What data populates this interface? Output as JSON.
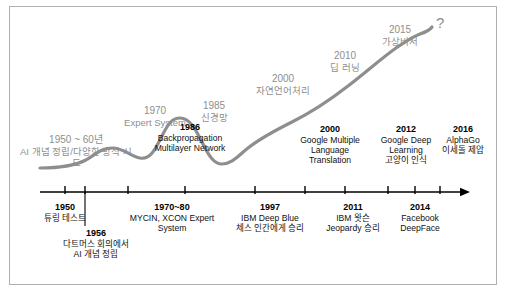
{
  "diagram": {
    "curve_color": "#8e8e8e",
    "axis_color": "#000000",
    "upper_label_color": "#8e8e8e",
    "lower_label_color": "#111111",
    "end_marker": "?"
  },
  "upper_labels": [
    {
      "year": "1950 ~ 60년",
      "text": "AI 개념 정립/다양한 방식 시도",
      "x": 76,
      "y": 134
    },
    {
      "year": "1970",
      "text": "Expert System",
      "x": 155,
      "y": 105
    },
    {
      "year": "1985",
      "text": "신경망",
      "x": 214,
      "y": 100
    },
    {
      "year": "2000",
      "text": "자연언어처리",
      "x": 283,
      "y": 73
    },
    {
      "year": "2010",
      "text": "딥 러닝",
      "x": 345,
      "y": 50
    },
    {
      "year": "2015",
      "text": "가상비서",
      "x": 400,
      "y": 24
    }
  ],
  "lower_labels": [
    {
      "year": "1986",
      "text": "Backpropagation\nMultilayer Network",
      "x": 190,
      "y": 122
    },
    {
      "year": "2000",
      "text": "Google Multiple\nLanguage\nTranslation",
      "x": 330,
      "y": 124
    },
    {
      "year": "2012",
      "text": "Google Deep\nLearning\n고양이 인식",
      "x": 406,
      "y": 124
    },
    {
      "year": "2016",
      "text": "AlphaGo\n이세돌 제압",
      "x": 463,
      "y": 124
    }
  ],
  "axis": {
    "y": 192,
    "x_start": 40,
    "x_end": 470,
    "ticks": [
      65,
      85,
      128,
      185,
      255,
      305,
      345,
      388,
      415,
      440
    ]
  },
  "bottom_labels": [
    {
      "year": "1950",
      "text": "튜링 테스트",
      "x": 65,
      "y": 202,
      "tick_x": 65,
      "drop": 8
    },
    {
      "year": "1956",
      "text": "다트머스 회의에서\nAI 개념 정립",
      "x": 96,
      "y": 228,
      "tick_x": 85,
      "drop": 34
    },
    {
      "year": "1970~80",
      "text": "MYCIN, XCON Expert\nSystem",
      "x": 172,
      "y": 202,
      "tick_x": 128,
      "drop": 8
    },
    {
      "year": "1997",
      "text": "IBM Deep Blue\n체스 인간에게 승리",
      "x": 270,
      "y": 202,
      "tick_x": 255,
      "drop": 8
    },
    {
      "year": "2011",
      "text": "IBM 왓슨\nJeopardy 승리",
      "x": 353,
      "y": 202,
      "tick_x": 345,
      "drop": 8
    },
    {
      "year": "2014",
      "text": "Facebook\nDeepFace",
      "x": 420,
      "y": 202,
      "tick_x": 415,
      "drop": 8
    }
  ],
  "question_mark": {
    "text": "?",
    "x": 436,
    "y": 14
  }
}
